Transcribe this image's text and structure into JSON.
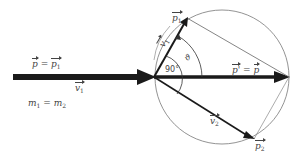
{
  "diagram": {
    "type": "elastic-collision-momentum-circle",
    "labels": {
      "incoming_momentum": {
        "lhs": "p",
        "eq": " = ",
        "rhs": "p",
        "rhs_sub": "1"
      },
      "incoming_velocity": {
        "symbol": "v",
        "sub": "1"
      },
      "mass_relation": {
        "lhs": "m",
        "lhs_sub": "1",
        "eq": " = ",
        "rhs": "m",
        "rhs_sub": "2"
      },
      "outgoing_p1": {
        "symbol": "p",
        "sub": "1"
      },
      "outgoing_v1": {
        "symbol": "v",
        "sub": "1"
      },
      "outgoing_p2": {
        "symbol": "p",
        "sub": "2"
      },
      "outgoing_v2": {
        "symbol": "v",
        "sub": "2"
      },
      "right_angle": "90°",
      "scatter_angle": "ϑ",
      "total_momentum": {
        "lhs": "p'",
        "eq": " = ",
        "rhs": "p"
      }
    },
    "geometry": {
      "origin": [
        154,
        77
      ],
      "circle_center": [
        222,
        77
      ],
      "circle_radius": 67,
      "incoming_arrow": {
        "from": [
          13,
          77
        ],
        "to": [
          154,
          77
        ]
      },
      "p1_tip": [
        187,
        18
      ],
      "p2_tip": [
        254,
        139
      ],
      "total_tip": [
        289,
        77
      ]
    },
    "colors": {
      "ink": "#1a1a1a",
      "thin_line": "#666666",
      "text": "#444444"
    }
  }
}
